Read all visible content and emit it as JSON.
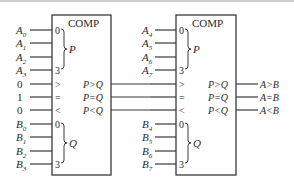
{
  "diagram": {
    "type": "cascaded 4-bit magnitude comparators",
    "comparator1": {
      "title": "COMP",
      "p_inputs": [
        "A",
        "A",
        "A",
        "A"
      ],
      "p_subscripts": [
        "0",
        "1",
        "2",
        "3"
      ],
      "q_inputs": [
        "B",
        "B",
        "B",
        "B"
      ],
      "q_subscripts": [
        "0",
        "1",
        "2",
        "3"
      ],
      "cascade_inputs": [
        {
          "value": "0",
          "pin": ">"
        },
        {
          "value": "1",
          "pin": "="
        },
        {
          "value": "0",
          "pin": "<"
        }
      ],
      "pin_first": "0",
      "pin_last": "3",
      "group_p": "P",
      "group_q": "Q",
      "outputs": [
        "P>Q",
        "P=Q",
        "P<Q"
      ]
    },
    "comparator2": {
      "title": "COMP",
      "p_inputs": [
        "A",
        "A",
        "A",
        "A"
      ],
      "p_subscripts": [
        "4",
        "5",
        "6",
        "7"
      ],
      "q_inputs": [
        "B",
        "B",
        "B",
        "B"
      ],
      "q_subscripts": [
        "4",
        "5",
        "6",
        "7"
      ],
      "cascade_pins": [
        ">",
        "=",
        "<"
      ],
      "pin_first": "0",
      "pin_last": "3",
      "group_p": "P",
      "group_q": "Q",
      "outputs": [
        "P>Q",
        "P=Q",
        "P<Q"
      ],
      "final_outputs": [
        "A>B",
        "A=B",
        "A<B"
      ]
    }
  }
}
